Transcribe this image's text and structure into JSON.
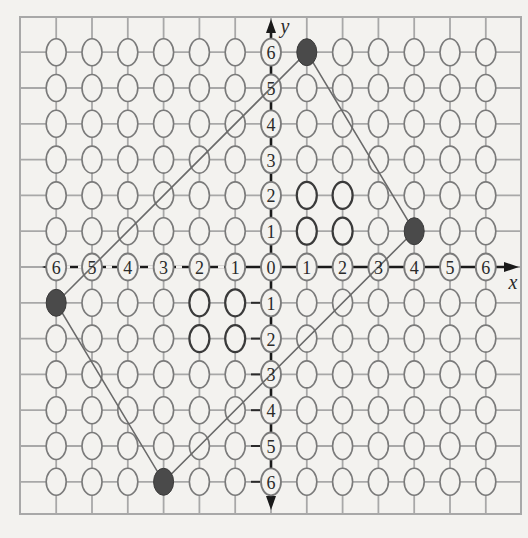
{
  "diagram": {
    "type": "coordinate-grid",
    "axes": {
      "x_label": "x",
      "y_label": "y",
      "x_range": [
        -6,
        6
      ],
      "y_range": [
        -6,
        6
      ],
      "x_tick_labels": [
        "6",
        "5",
        "4",
        "3",
        "2",
        "1",
        "0",
        "1",
        "2",
        "3",
        "4",
        "5",
        "6"
      ],
      "y_tick_labels_positive": [
        "1",
        "2",
        "3",
        "4",
        "5",
        "6"
      ],
      "y_tick_labels_negative": [
        "1",
        "2",
        "3",
        "4",
        "5",
        "6"
      ],
      "negative_marker": "dash-prefix"
    },
    "grid": {
      "columns": 14,
      "rows": 14,
      "point_shape": "open-ellipse",
      "emphasized_points": [
        [
          1,
          1
        ],
        [
          1,
          2
        ],
        [
          2,
          1
        ],
        [
          2,
          2
        ],
        [
          -1,
          -1
        ],
        [
          -1,
          -2
        ],
        [
          -2,
          -1
        ],
        [
          -2,
          -2
        ]
      ]
    },
    "polygon": {
      "vertices": [
        [
          1,
          6
        ],
        [
          4,
          1
        ],
        [
          -3,
          -6
        ],
        [
          -6,
          -1
        ]
      ],
      "vertex_style": "filled-ellipse"
    },
    "colors": {
      "background": "#f3f2ef",
      "grid_line": "#a8a8a8",
      "ellipse_stroke": "#7a7a7a",
      "ellipse_emphasis": "#3a3a3a",
      "axis": "#1a1a1a",
      "polygon_line": "#6a6a6a",
      "vertex_fill": "#4a4a4a"
    }
  }
}
